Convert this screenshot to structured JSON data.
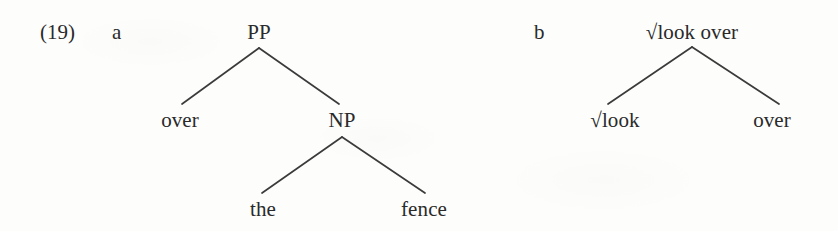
{
  "figure": {
    "example_number": "(19)",
    "background_color": "#fdfdfc",
    "text_color": "#2a2a2a",
    "line_color": "#3b3b3b",
    "width": 838,
    "height": 231
  },
  "subexamples": [
    {
      "label": "a",
      "label_x": 112,
      "label_y": 22,
      "tree": {
        "type": "syntax-tree",
        "nodes": [
          {
            "id": "pp",
            "text": "PP",
            "x": 259,
            "y": 22,
            "role": "root"
          },
          {
            "id": "over1",
            "text": "over",
            "x": 180,
            "y": 110,
            "role": "terminal"
          },
          {
            "id": "np",
            "text": "NP",
            "x": 342,
            "y": 110,
            "role": "nonterminal"
          },
          {
            "id": "the",
            "text": "the",
            "x": 263,
            "y": 199,
            "role": "terminal"
          },
          {
            "id": "fence",
            "text": "fence",
            "x": 424,
            "y": 199,
            "role": "terminal"
          }
        ],
        "edges": [
          {
            "from": "pp",
            "to": "over1",
            "x1": 259,
            "y1": 48,
            "x2": 182,
            "y2": 104
          },
          {
            "from": "pp",
            "to": "np",
            "x1": 259,
            "y1": 48,
            "x2": 339,
            "y2": 104
          },
          {
            "from": "np",
            "to": "the",
            "x1": 342,
            "y1": 137,
            "x2": 262,
            "y2": 193
          },
          {
            "from": "np",
            "to": "fence",
            "x1": 342,
            "y1": 137,
            "x2": 425,
            "y2": 193
          }
        ]
      }
    },
    {
      "label": "b",
      "label_x": 534,
      "label_y": 22,
      "tree": {
        "type": "syntax-tree",
        "nodes": [
          {
            "id": "rootlookover",
            "text": "√look over",
            "x": 692,
            "y": 22,
            "role": "root"
          },
          {
            "id": "rootlook",
            "text": "√look",
            "x": 615,
            "y": 110,
            "role": "terminal"
          },
          {
            "id": "over2",
            "text": "over",
            "x": 772,
            "y": 110,
            "role": "terminal"
          }
        ],
        "edges": [
          {
            "from": "rootlookover",
            "to": "rootlook",
            "x1": 692,
            "y1": 47,
            "x2": 608,
            "y2": 104
          },
          {
            "from": "rootlookover",
            "to": "over2",
            "x1": 692,
            "y1": 47,
            "x2": 779,
            "y2": 104
          }
        ]
      }
    }
  ]
}
